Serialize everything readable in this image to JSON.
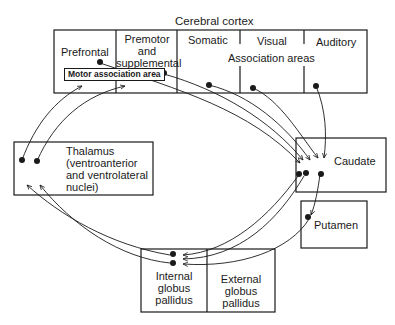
{
  "diagram": {
    "cortex": {
      "title": "Cerebral cortex",
      "regions": [
        {
          "label": "Prefrontal"
        },
        {
          "label": "Premotor and supplemental",
          "lines": [
            "Premotor",
            "and",
            "supplemental"
          ]
        },
        {
          "label": "Somatic"
        },
        {
          "label": "Visual"
        },
        {
          "label": "Auditory"
        }
      ],
      "motor_association_label": "Motor association area",
      "association_label": "Association areas"
    },
    "thalamus": {
      "lines": [
        "Thalamus",
        "(ventroanterior",
        "and ventrolateral",
        "nuclei)"
      ]
    },
    "caudate": {
      "label": "Caudate"
    },
    "putamen": {
      "label": "Putamen"
    },
    "globus_pallidus": {
      "internal": {
        "lines": [
          "Internal",
          "globus",
          "pallidus"
        ]
      },
      "external": {
        "lines": [
          "External",
          "globus",
          "pallidus"
        ]
      }
    },
    "connections": [
      {
        "from": "Prefrontal",
        "to": "Caudate"
      },
      {
        "from": "Premotor and supplemental",
        "to": "Caudate"
      },
      {
        "from": "Somatic",
        "to": "Caudate"
      },
      {
        "from": "Visual",
        "to": "Caudate"
      },
      {
        "from": "Auditory",
        "to": "Caudate"
      },
      {
        "from": "Caudate",
        "to": "Putamen"
      },
      {
        "from": "Caudate",
        "to": "Internal globus pallidus"
      },
      {
        "from": "Putamen",
        "to": "Internal globus pallidus"
      },
      {
        "from": "Internal globus pallidus",
        "to": "Thalamus"
      },
      {
        "from": "Thalamus",
        "to": "Motor association area"
      }
    ],
    "colors": {
      "ink": "#1a1a1a",
      "background": "#ffffff"
    }
  }
}
